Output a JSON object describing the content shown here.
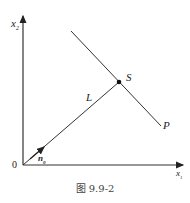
{
  "figure": {
    "caption": "图 9.9-2",
    "axes": {
      "x_label": "x",
      "x_sub": "1",
      "y_label": "x",
      "y_sub": "2",
      "origin_label": "0"
    },
    "points": {
      "S": "S",
      "P": "P",
      "L": "L"
    },
    "vector": {
      "label": "n",
      "sub": "0"
    },
    "colors": {
      "line": "#333333",
      "text": "#222222"
    }
  }
}
